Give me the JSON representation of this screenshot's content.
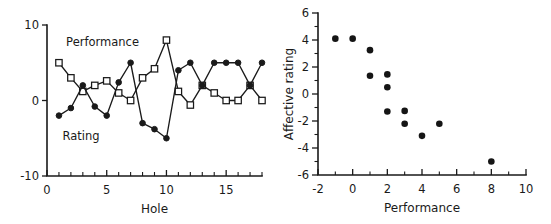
{
  "figure": {
    "panels": [
      "left-line-chart",
      "right-scatter-chart"
    ]
  },
  "chart_data": [
    {
      "id": "left",
      "type": "line",
      "title": "",
      "xlabel": "Hole",
      "ylabel": "",
      "xlim": [
        0,
        18
      ],
      "ylim": [
        -10,
        10
      ],
      "xticks": [
        0,
        5,
        10,
        15
      ],
      "xticklabels": [
        "0",
        "5",
        "10",
        "15"
      ],
      "xminorticks": [
        1,
        2,
        3,
        4,
        6,
        7,
        8,
        9,
        11,
        12,
        13,
        14,
        16,
        17,
        18
      ],
      "yticks": [
        -10,
        0,
        10
      ],
      "yticklabels": [
        "-10",
        "0",
        "10"
      ],
      "grid": false,
      "legend": "inline-annotations",
      "x": [
        1,
        2,
        3,
        4,
        5,
        6,
        7,
        8,
        9,
        10,
        11,
        12,
        13,
        14,
        15,
        16,
        17,
        18
      ],
      "series": [
        {
          "name": "Performance",
          "marker": "open-square",
          "annotation": "Performance",
          "annotation_xy": [
            1.6,
            7.2
          ],
          "values": [
            5,
            3,
            1.2,
            2,
            2.6,
            1,
            0,
            3,
            4.2,
            8,
            1.2,
            -0.6,
            2,
            1,
            0,
            0,
            2,
            0
          ]
        },
        {
          "name": "Rating",
          "marker": "filled-circle",
          "annotation": "Rating",
          "annotation_xy": [
            1.3,
            -5.2
          ],
          "values": [
            -2,
            -1,
            2,
            -0.8,
            -2,
            2.4,
            5,
            -3,
            -3.8,
            -5,
            4,
            5,
            2,
            5,
            5,
            5,
            2,
            5
          ]
        }
      ]
    },
    {
      "id": "right",
      "type": "scatter",
      "title": "",
      "xlabel": "Performance",
      "ylabel": "Affective rating",
      "xlim": [
        -2,
        10
      ],
      "ylim": [
        -6,
        6
      ],
      "xticks": [
        -2,
        0,
        2,
        4,
        6,
        8,
        10
      ],
      "xticklabels": [
        "-2",
        "0",
        "2",
        "4",
        "6",
        "8",
        "10"
      ],
      "xminorticks": [
        -1,
        1,
        3,
        5,
        7,
        9
      ],
      "yticks": [
        -6,
        -4,
        -2,
        0,
        2,
        4,
        6
      ],
      "yticklabels": [
        "-6",
        "-4",
        "-2",
        "0",
        "2",
        "4",
        "6"
      ],
      "yminorticks": [
        -5,
        -3,
        -1,
        1,
        3,
        5
      ],
      "grid": false,
      "marker": "filled-circle",
      "points": [
        {
          "x": -1,
          "y": 4.1
        },
        {
          "x": 0,
          "y": 4.1
        },
        {
          "x": 1,
          "y": 3.25
        },
        {
          "x": 1,
          "y": 1.35
        },
        {
          "x": 2,
          "y": 1.45
        },
        {
          "x": 2,
          "y": 0.5
        },
        {
          "x": 2,
          "y": -1.3
        },
        {
          "x": 3,
          "y": -1.25
        },
        {
          "x": 3,
          "y": -2.2
        },
        {
          "x": 4,
          "y": -3.1
        },
        {
          "x": 5,
          "y": -2.2
        },
        {
          "x": 8,
          "y": -5.0
        }
      ]
    }
  ]
}
